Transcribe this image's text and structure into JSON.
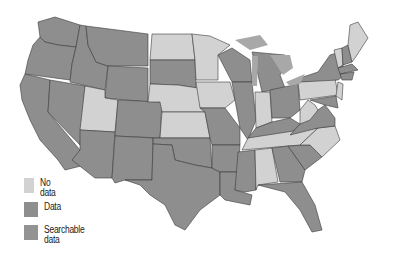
{
  "map": {
    "title": "United States",
    "colors": {
      "no_data": "#d2d2d2",
      "data": "#8e8e8e",
      "searchable_data": "#939393",
      "lakes": "#a8a8a8",
      "border": "#3a3a3a"
    },
    "states": {
      "no_data": [
        "ND",
        "MN",
        "NE",
        "KS",
        "IA",
        "UT",
        "IN",
        "PA",
        "WV",
        "TN",
        "NC",
        "AL",
        "ME",
        "VT",
        "DE",
        "NJ"
      ],
      "data": [
        "WA",
        "OR",
        "CA",
        "NV",
        "ID",
        "MT",
        "WY",
        "CO",
        "AZ",
        "NM",
        "SD",
        "OK",
        "TX",
        "MO",
        "AR",
        "LA",
        "MS",
        "IL",
        "WI",
        "MI",
        "OH",
        "KY",
        "VA",
        "SC",
        "GA",
        "FL",
        "NY",
        "NH",
        "MA",
        "CT",
        "RI",
        "MD"
      ]
    }
  },
  "legend": {
    "items": [
      {
        "label": "No data",
        "color": "#d2d2d2"
      },
      {
        "label": "Data",
        "color": "#8e8e8e"
      },
      {
        "label_line1": "Searchable",
        "label_line2": "data",
        "color": "#939393"
      }
    ]
  }
}
